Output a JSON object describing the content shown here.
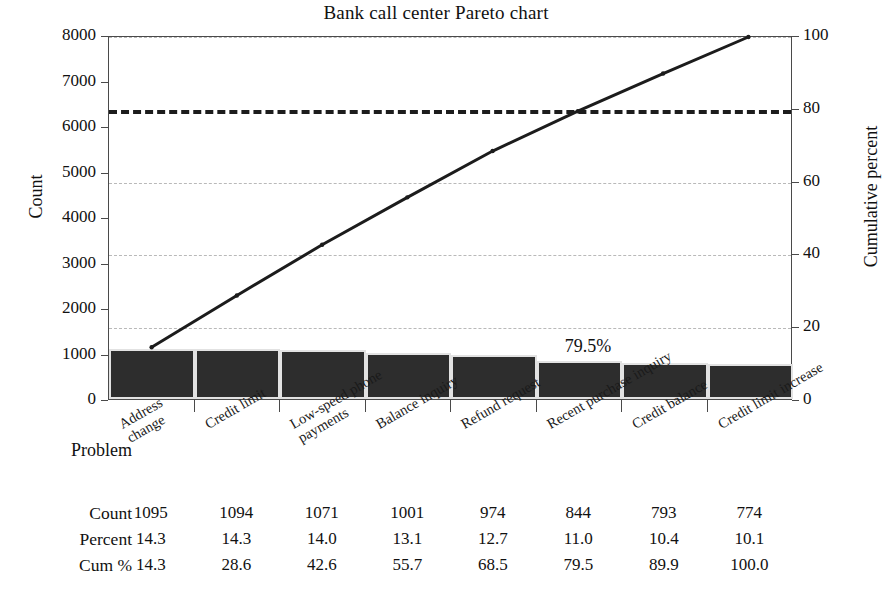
{
  "chart_data": {
    "type": "bar",
    "title": "Bank call center Pareto chart",
    "xlabel": "Problem",
    "ylabel": "Count",
    "y2label": "Cumulative percent",
    "categories": [
      "Address change",
      "Credit limit",
      "Low-speed phone payments",
      "Balance inquiry",
      "Refund request",
      "Recent purchase inquiry",
      "Credit balance",
      "Credit limit increase"
    ],
    "values": [
      1095,
      1094,
      1071,
      1001,
      974,
      844,
      793,
      774
    ],
    "percent": [
      14.3,
      14.3,
      14.0,
      13.1,
      12.7,
      11.0,
      10.4,
      10.1
    ],
    "cumulative_percent": [
      14.3,
      28.6,
      42.6,
      55.7,
      68.5,
      79.5,
      89.9,
      100.0
    ],
    "ylim": [
      0,
      8000
    ],
    "y2lim": [
      0,
      100
    ],
    "yticks": [
      "0",
      "1000",
      "2000",
      "3000",
      "4000",
      "5000",
      "6000",
      "7000",
      "8000"
    ],
    "ytick_values": [
      0,
      1000,
      2000,
      3000,
      4000,
      5000,
      6000,
      7000,
      8000
    ],
    "y2ticks": [
      "0",
      "20",
      "40",
      "60",
      "80",
      "100"
    ],
    "y2tick_values": [
      0,
      20,
      40,
      60,
      80,
      100
    ],
    "gridlines_at": [
      20,
      40,
      60,
      100
    ],
    "reference_line": 80,
    "grid": true,
    "legend": "none",
    "annotation": "79.5%",
    "annotation_category_index": 5,
    "series": [
      {
        "name": "Count",
        "type": "bar",
        "values": [
          1095,
          1094,
          1071,
          1001,
          974,
          844,
          793,
          774
        ]
      },
      {
        "name": "Cum %",
        "type": "line",
        "values": [
          14.3,
          28.6,
          42.6,
          55.7,
          68.5,
          79.5,
          89.9,
          100.0
        ]
      }
    ],
    "colors": {
      "bar_fill": "#2d2d2d",
      "bar_edge": "#e2e2e2",
      "line": "#1c1c1c",
      "gridline": "#b9b9b9",
      "reference_line": "#1c1c1c",
      "axis": "#4a4a4a",
      "text": "#111111",
      "background": "#ffffff"
    }
  },
  "table": {
    "row_labels": [
      "Count",
      "Percent",
      "Cum %"
    ],
    "rows": [
      [
        "1095",
        "1094",
        "1071",
        "1001",
        "974",
        "844",
        "793",
        "774"
      ],
      [
        "14.3",
        "14.3",
        "14.0",
        "13.1",
        "12.7",
        "11.0",
        "10.4",
        "10.1"
      ],
      [
        "14.3",
        "28.6",
        "42.6",
        "55.7",
        "68.5",
        "79.5",
        "89.9",
        "100.0"
      ]
    ]
  }
}
